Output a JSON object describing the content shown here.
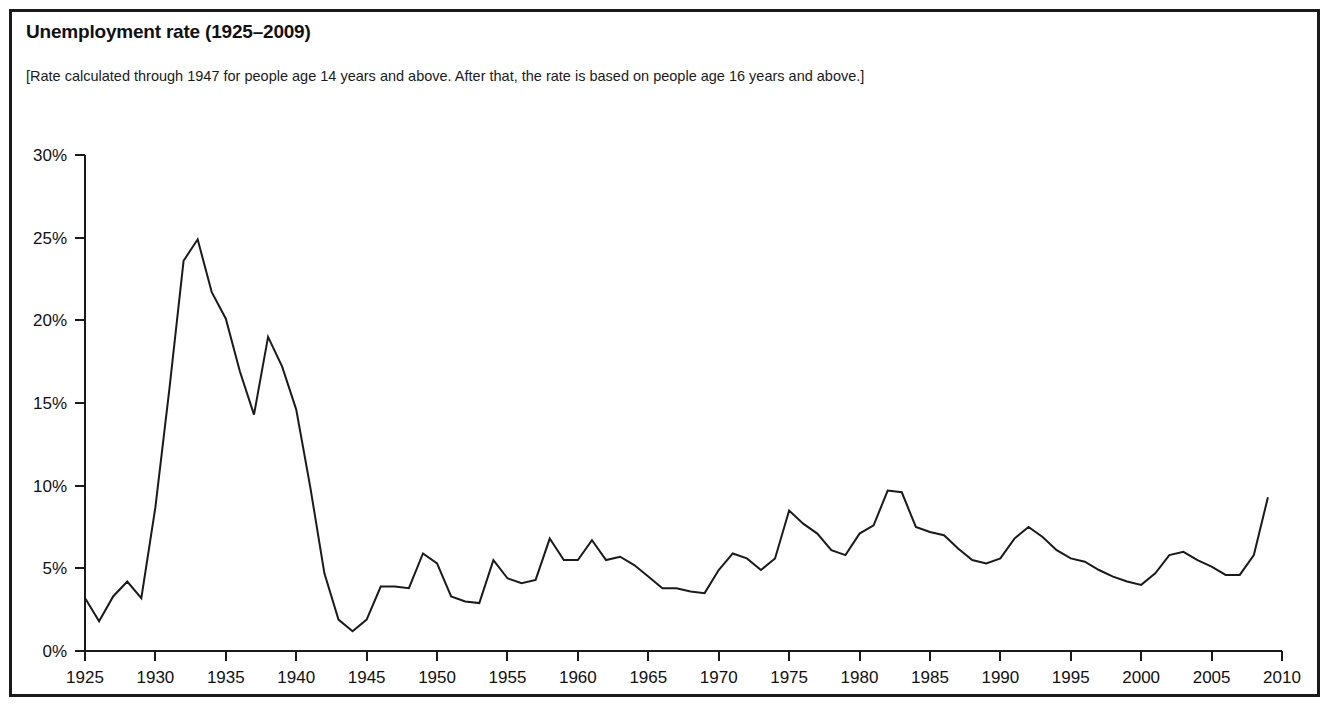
{
  "figure": {
    "title": "Unemployment rate (1925–2009)",
    "subtitle": "[Rate calculated through 1947 for people age 14 years and above. After that, the rate is based on people age 16 years and above.]",
    "border_color": "#1a1a1a",
    "line_color": "#1a1a1a",
    "background": "#ffffff"
  },
  "chart_data": {
    "type": "line",
    "title": "Unemployment rate (1925–2009)",
    "subtitle": "[Rate calculated through 1947 for people age 14 years and above. After that, the rate is based on people age 16 years and above.]",
    "xlabel": "",
    "ylabel": "",
    "xlim": [
      1925,
      2010
    ],
    "ylim": [
      0,
      30
    ],
    "grid": false,
    "legend": false,
    "y_tick_labels": [
      "0%",
      "5%",
      "10%",
      "15%",
      "20%",
      "25%",
      "30%"
    ],
    "y_ticks": [
      0,
      5,
      10,
      15,
      20,
      25,
      30
    ],
    "x_tick_labels": [
      "1925",
      "1930",
      "1935",
      "1940",
      "1945",
      "1950",
      "1955",
      "1960",
      "1965",
      "1970",
      "1975",
      "1980",
      "1985",
      "1990",
      "1995",
      "2000",
      "2005",
      "2010"
    ],
    "x_ticks": [
      1925,
      1930,
      1935,
      1940,
      1945,
      1950,
      1955,
      1960,
      1965,
      1970,
      1975,
      1980,
      1985,
      1990,
      1995,
      2000,
      2005,
      2010
    ],
    "units": "percent",
    "series": [
      {
        "name": "Unemployment rate",
        "x": [
          1925,
          1926,
          1927,
          1928,
          1929,
          1930,
          1931,
          1932,
          1933,
          1934,
          1935,
          1936,
          1937,
          1938,
          1939,
          1940,
          1941,
          1942,
          1943,
          1944,
          1945,
          1946,
          1947,
          1948,
          1949,
          1950,
          1951,
          1952,
          1953,
          1954,
          1955,
          1956,
          1957,
          1958,
          1959,
          1960,
          1961,
          1962,
          1963,
          1964,
          1965,
          1966,
          1967,
          1968,
          1969,
          1970,
          1971,
          1972,
          1973,
          1974,
          1975,
          1976,
          1977,
          1978,
          1979,
          1980,
          1981,
          1982,
          1983,
          1984,
          1985,
          1986,
          1987,
          1988,
          1989,
          1990,
          1991,
          1992,
          1993,
          1994,
          1995,
          1996,
          1997,
          1998,
          1999,
          2000,
          2001,
          2002,
          2003,
          2004,
          2005,
          2006,
          2007,
          2008,
          2009
        ],
        "values": [
          3.2,
          1.8,
          3.3,
          4.2,
          3.2,
          8.7,
          15.9,
          23.6,
          24.9,
          21.7,
          20.1,
          16.9,
          14.3,
          19.0,
          17.2,
          14.6,
          9.9,
          4.7,
          1.9,
          1.2,
          1.9,
          3.9,
          3.9,
          3.8,
          5.9,
          5.3,
          3.3,
          3.0,
          2.9,
          5.5,
          4.4,
          4.1,
          4.3,
          6.8,
          5.5,
          5.5,
          6.7,
          5.5,
          5.7,
          5.2,
          4.5,
          3.8,
          3.8,
          3.6,
          3.5,
          4.9,
          5.9,
          5.6,
          4.9,
          5.6,
          8.5,
          7.7,
          7.1,
          6.1,
          5.8,
          7.1,
          7.6,
          9.7,
          9.6,
          7.5,
          7.2,
          7.0,
          6.2,
          5.5,
          5.3,
          5.6,
          6.8,
          7.5,
          6.9,
          6.1,
          5.6,
          5.4,
          4.9,
          4.5,
          4.2,
          4.0,
          4.7,
          5.8,
          6.0,
          5.5,
          5.1,
          4.6,
          4.6,
          5.8,
          9.3
        ]
      }
    ]
  },
  "axes": {
    "y_axis_name": "unemployment-rate-percent",
    "x_axis_name": "year"
  }
}
